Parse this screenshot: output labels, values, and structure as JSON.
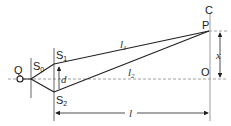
{
  "diagram": {
    "type": "double-slit-interference",
    "labels": {
      "source": "Q",
      "single_slit": "S",
      "single_slit_sub": "0",
      "slit1": "S",
      "slit1_sub": "1",
      "slit2": "S",
      "slit2_sub": "2",
      "slit_separation": "d",
      "path1": "l",
      "path1_sub": "1",
      "path2": "l",
      "path2_sub": "2",
      "screen": "C",
      "point": "P",
      "center": "O",
      "displacement": "x",
      "distance": "l"
    },
    "colors": {
      "line": "#222222",
      "dashed": "#888888",
      "screen": "#999999"
    }
  }
}
